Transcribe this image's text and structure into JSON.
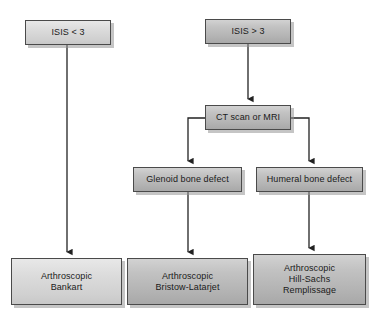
{
  "diagram": {
    "background_color": "#ffffff",
    "line_color": "#222222",
    "node_border_color": "#4a4a4a",
    "node_fill_light": "#d8d8d8",
    "node_fill_dark": "#bdbdbd",
    "nodes": [
      {
        "id": "isis-lt-3",
        "label": "ISIS < 3",
        "x": 25,
        "y": 20,
        "w": 86,
        "h": 25,
        "tone": "light"
      },
      {
        "id": "isis-gt-3",
        "label": "ISIS > 3",
        "x": 205,
        "y": 19,
        "w": 86,
        "h": 25,
        "tone": "dark"
      },
      {
        "id": "ct-scan-or-mri",
        "label": "CT scan or MRI",
        "x": 205,
        "y": 105,
        "w": 86,
        "h": 25,
        "tone": "dark"
      },
      {
        "id": "glenoid-bone-defect",
        "label": "Glenoid bone defect",
        "x": 133,
        "y": 167,
        "w": 109,
        "h": 25,
        "tone": "dark"
      },
      {
        "id": "humeral-bone-defect",
        "label": "Humeral bone defect",
        "x": 256,
        "y": 167,
        "w": 107,
        "h": 25,
        "tone": "dark"
      },
      {
        "id": "arthroscopic-bankart",
        "label": "Arthroscopic\nBankart",
        "x": 11,
        "y": 258,
        "w": 111,
        "h": 47,
        "tone": "light"
      },
      {
        "id": "arthroscopic-bristow-latarjet",
        "label": "Arthroscopic\nBristow-Latarjet",
        "x": 127,
        "y": 258,
        "w": 121,
        "h": 47,
        "tone": "dark"
      },
      {
        "id": "arthroscopic-hill-sachs-remplissage",
        "label": "Arthroscopic\nHill-Sachs\nRemplissage",
        "x": 253,
        "y": 254,
        "w": 113,
        "h": 51,
        "tone": "dark"
      }
    ],
    "connectors": [
      {
        "id": "isis-lt-3-to-bankart",
        "from": "isis-lt-3",
        "to": "arthroscopic-bankart",
        "kind": "straight-down"
      },
      {
        "id": "isis-gt-3-to-ct",
        "from": "isis-gt-3",
        "to": "ct-scan-or-mri",
        "kind": "straight-down"
      },
      {
        "id": "ct-to-glenoid",
        "from": "ct-scan-or-mri",
        "to": "glenoid-bone-defect",
        "kind": "elbow-left"
      },
      {
        "id": "ct-to-humeral",
        "from": "ct-scan-or-mri",
        "to": "humeral-bone-defect",
        "kind": "elbow-right"
      },
      {
        "id": "glenoid-to-bristow-latarjet",
        "from": "glenoid-bone-defect",
        "to": "arthroscopic-bristow-latarjet",
        "kind": "straight-down"
      },
      {
        "id": "humeral-to-remplissage",
        "from": "humeral-bone-defect",
        "to": "arthroscopic-hill-sachs-remplissage",
        "kind": "straight-down"
      }
    ]
  }
}
